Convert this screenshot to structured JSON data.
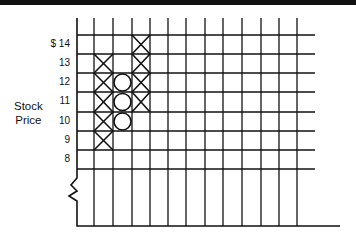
{
  "chart_data": {
    "type": "point-and-figure",
    "title": "",
    "xlabel": "",
    "ylabel": "Stock Price",
    "y_ticks": [
      "$ 14",
      "13",
      "12",
      "11",
      "10",
      "9",
      "8"
    ],
    "y_values": [
      14,
      13,
      12,
      11,
      10,
      9,
      8
    ],
    "ylim": [
      8,
      14
    ],
    "box_size": 1,
    "axis_break": true,
    "grid": true,
    "num_columns": 12,
    "columns": [
      {
        "index": 1,
        "symbol": "X",
        "direction": "up",
        "from": 9,
        "to": 13,
        "values": [
          9,
          10,
          11,
          12,
          13
        ]
      },
      {
        "index": 2,
        "symbol": "O",
        "direction": "down",
        "from": 12,
        "to": 10,
        "values": [
          12,
          11,
          10
        ]
      },
      {
        "index": 3,
        "symbol": "X",
        "direction": "up",
        "from": 11,
        "to": 14,
        "values": [
          11,
          12,
          13,
          14
        ]
      }
    ]
  },
  "axis": {
    "title_line1": "Stock",
    "title_line2": "Price",
    "ticks": [
      "$ 14",
      "13",
      "12",
      "11",
      "10",
      "9",
      "8"
    ]
  },
  "colors": {
    "ink": "#111111",
    "background": "#ffffff"
  }
}
